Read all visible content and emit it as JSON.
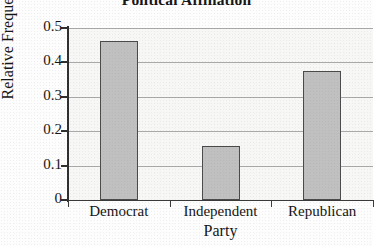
{
  "chart_data": {
    "type": "bar",
    "title": "Political Affiliation",
    "xlabel": "Party",
    "ylabel": "Relative Frequency",
    "categories": [
      "Democrat",
      "Independent",
      "Republican"
    ],
    "values": [
      0.463,
      0.158,
      0.374
    ],
    "ylim": [
      0,
      0.5
    ],
    "ytick_labels": [
      "0.5",
      "0.4",
      "0.3",
      "0.2",
      "0.1",
      "0"
    ],
    "ytick_values": [
      0.5,
      0.4,
      0.3,
      0.2,
      0.1,
      0
    ],
    "grid": true,
    "legend": false,
    "legend_position": "none",
    "bar_fill_color": "#c0c0c0",
    "bar_border_color": "#4a4a4a",
    "gridline_color": "#a9a9a9",
    "axis_color": "#2e2e2e",
    "plot_background_color": "#f7f7f5"
  }
}
